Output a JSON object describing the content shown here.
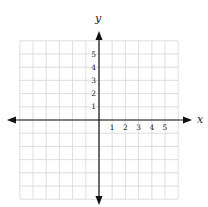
{
  "chart_data": {
    "type": "scatter",
    "title": "",
    "xlabel": "x",
    "ylabel": "y",
    "x_ticks": [
      "1",
      "2",
      "3",
      "4",
      "5"
    ],
    "y_ticks": [
      "1",
      "2",
      "3",
      "4",
      "5"
    ],
    "xlim": [
      -6,
      6
    ],
    "ylim": [
      -6,
      6
    ],
    "grid": true,
    "points": []
  },
  "axes": {
    "x_label": "x",
    "y_label": "y",
    "x_tick_labels": [
      "1",
      "2",
      "3",
      "4",
      "5"
    ],
    "y_tick_labels": [
      "1",
      "2",
      "3",
      "4",
      "5"
    ]
  },
  "colors": {
    "grid": "#d6d6d6",
    "axis": "#111111",
    "text": "#222222"
  }
}
